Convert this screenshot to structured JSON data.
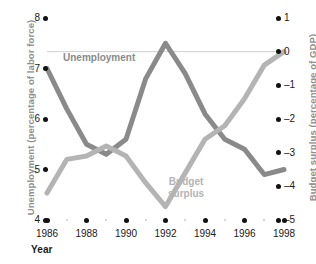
{
  "chart_data": {
    "type": "line",
    "title": "",
    "xlabel": "Year",
    "x": [
      1986,
      1987,
      1988,
      1989,
      1990,
      1991,
      1992,
      1993,
      1994,
      1995,
      1996,
      1997,
      1998
    ],
    "xtick_labels": [
      "1986",
      "1988",
      "1990",
      "1992",
      "1994",
      "1996",
      "1998"
    ],
    "xticks": [
      1986,
      1988,
      1990,
      1992,
      1994,
      1996,
      1998
    ],
    "xlim": [
      1986,
      1998
    ],
    "grid": false,
    "zero_gridline": 0,
    "legend": "inline-labels",
    "series": [
      {
        "name": "Unemployment",
        "axis": "left",
        "color": "#8a8a8a",
        "ylabel": "Unemployment (percentage of labor force)",
        "ylim": [
          4,
          8
        ],
        "yticks": [
          4,
          5,
          6,
          7,
          8
        ],
        "ytick_labels": [
          "4",
          "5",
          "6",
          "7",
          "8"
        ],
        "values": [
          7.0,
          6.2,
          5.5,
          5.3,
          5.6,
          6.8,
          7.5,
          6.9,
          6.1,
          5.6,
          5.4,
          4.9,
          5.0
        ]
      },
      {
        "name": "Budget surplus",
        "axis": "right",
        "color": "#b4b4b4",
        "ylabel": "Budget surplus (percentage of GDP)",
        "ylim": [
          -5,
          1
        ],
        "yticks": [
          1,
          0,
          -1,
          -2,
          -3,
          -4,
          -5
        ],
        "ytick_labels": [
          "1",
          "0",
          "-1",
          "-2",
          "-3",
          "-4",
          "-5"
        ],
        "values": [
          -4.2,
          -3.2,
          -3.1,
          -2.8,
          -3.1,
          -3.9,
          -4.6,
          -3.6,
          -2.6,
          -2.2,
          -1.4,
          -0.4,
          0.0
        ]
      }
    ]
  },
  "labels": {
    "unemployment": "Unemployment",
    "budget_surplus": "Budget\nsurplus",
    "y_left_title": "Unemployment (percentage of labor force)",
    "y_right_title": "Budget surplus (percentage of GDP)",
    "x_title": "Year"
  },
  "colors": {
    "unemployment": "#8a8a8a",
    "budget_surplus": "#b4b4b4",
    "gridline": "#cfcfcf",
    "tick_dot": "#111111",
    "minor_dot": "#c9c9c9",
    "axis_title": "#8f8f8f"
  }
}
